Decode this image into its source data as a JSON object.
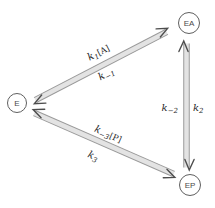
{
  "colors": {
    "bg": "#ffffff",
    "band_fill": "#e3e3e3",
    "band_edge": "#9a9a9a",
    "arrow": "#4d4d4d",
    "node_stroke": "#5f5f5f",
    "node_text": "#4a4a4a",
    "label_text": "#1f1f1f"
  },
  "nodes": {
    "e": {
      "label": "E"
    },
    "ea": {
      "label": "EA"
    },
    "ep": {
      "label": "EP"
    }
  },
  "edges": {
    "e_ea": {
      "label_above": {
        "k": "k",
        "sub": "1",
        "arg": "[A]"
      },
      "label_below": {
        "k": "k",
        "sub": "−1",
        "arg": ""
      }
    },
    "ea_ep": {
      "label_left": {
        "k": "k",
        "sub": "−2",
        "arg": ""
      },
      "label_right": {
        "k": "k",
        "sub": "2",
        "arg": ""
      }
    },
    "e_ep": {
      "label_above": {
        "k": "k",
        "sub": "−3",
        "arg": "[P]"
      },
      "label_below": {
        "k": "k",
        "sub": "3",
        "arg": ""
      }
    }
  }
}
